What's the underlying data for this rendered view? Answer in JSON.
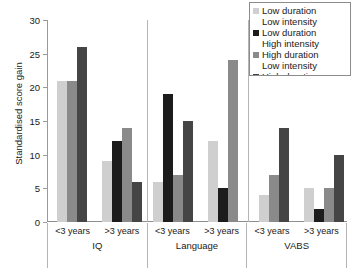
{
  "chart_data": {
    "type": "bar",
    "title": "",
    "xlabel": "",
    "ylabel": "Standardised score gain",
    "ylim": [
      0,
      30
    ],
    "yticks": [
      0,
      5,
      10,
      15,
      20,
      25,
      30
    ],
    "grid": false,
    "legend_position": "top-right",
    "panels": [
      "IQ",
      "Language",
      "VABS"
    ],
    "groups": [
      "<3 years",
      ">3 years"
    ],
    "series": [
      {
        "name": "Low duration Low intensity",
        "color": "#cfcfcf"
      },
      {
        "name": "Low duration High intensity",
        "color": "#1c1c1c"
      },
      {
        "name": "High duration Low intensity",
        "color": "#8a8a8a"
      },
      {
        "name": "High duration High intensity",
        "color": "#454545"
      }
    ],
    "bars": [
      {
        "panel": "IQ",
        "group": "<3 years",
        "series": "Low duration Low intensity",
        "value": 21,
        "color": "#cfcfcf"
      },
      {
        "panel": "IQ",
        "group": "<3 years",
        "series": "High duration Low intensity",
        "value": 21,
        "color": "#8a8a8a"
      },
      {
        "panel": "IQ",
        "group": "<3 years",
        "series": "High duration High intensity",
        "value": 26,
        "color": "#454545"
      },
      {
        "panel": "IQ",
        "group": ">3 years",
        "series": "Low duration Low intensity",
        "value": 9,
        "color": "#cfcfcf"
      },
      {
        "panel": "IQ",
        "group": ">3 years",
        "series": "Low duration High intensity",
        "value": 12,
        "color": "#1c1c1c"
      },
      {
        "panel": "IQ",
        "group": ">3 years",
        "series": "High duration Low intensity",
        "value": 14,
        "color": "#8a8a8a"
      },
      {
        "panel": "IQ",
        "group": ">3 years",
        "series": "High duration High intensity",
        "value": 6,
        "color": "#454545"
      },
      {
        "panel": "Language",
        "group": "<3 years",
        "series": "Low duration Low intensity",
        "value": 6,
        "color": "#cfcfcf"
      },
      {
        "panel": "Language",
        "group": "<3 years",
        "series": "Low duration High intensity",
        "value": 19,
        "color": "#1c1c1c"
      },
      {
        "panel": "Language",
        "group": "<3 years",
        "series": "High duration Low intensity",
        "value": 7,
        "color": "#8a8a8a"
      },
      {
        "panel": "Language",
        "group": "<3 years",
        "series": "High duration High intensity",
        "value": 15,
        "color": "#454545"
      },
      {
        "panel": "Language",
        "group": ">3 years",
        "series": "Low duration Low intensity",
        "value": 12,
        "color": "#cfcfcf"
      },
      {
        "panel": "Language",
        "group": ">3 years",
        "series": "Low duration High intensity",
        "value": 5,
        "color": "#1c1c1c"
      },
      {
        "panel": "Language",
        "group": ">3 years",
        "series": "High duration Low intensity",
        "value": 24,
        "color": "#8a8a8a"
      },
      {
        "panel": "VABS",
        "group": "<3 years",
        "series": "Low duration Low intensity",
        "value": 4,
        "color": "#cfcfcf"
      },
      {
        "panel": "VABS",
        "group": "<3 years",
        "series": "High duration Low intensity",
        "value": 7,
        "color": "#8a8a8a"
      },
      {
        "panel": "VABS",
        "group": "<3 years",
        "series": "High duration High intensity",
        "value": 14,
        "color": "#454545"
      },
      {
        "panel": "VABS",
        "group": ">3 years",
        "series": "Low duration Low intensity",
        "value": 5,
        "color": "#cfcfcf"
      },
      {
        "panel": "VABS",
        "group": ">3 years",
        "series": "Low duration High intensity",
        "value": 2,
        "color": "#1c1c1c"
      },
      {
        "panel": "VABS",
        "group": ">3 years",
        "series": "High duration Low intensity",
        "value": 5,
        "color": "#8a8a8a"
      },
      {
        "panel": "VABS",
        "group": ">3 years",
        "series": "High duration High intensity",
        "value": 10,
        "color": "#454545"
      }
    ]
  },
  "legend": {
    "entries": [
      {
        "line1": "Low duration",
        "line2": "Low intensity",
        "color": "#cfcfcf"
      },
      {
        "line1": "Low duration",
        "line2": "High intensity",
        "color": "#1c1c1c"
      },
      {
        "line1": "High duration",
        "line2": "Low intensity",
        "color": "#8a8a8a"
      },
      {
        "line1": "High duration",
        "line2": "High intensity",
        "color": "#454545"
      }
    ]
  }
}
